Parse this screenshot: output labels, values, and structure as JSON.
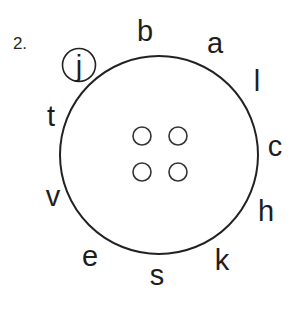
{
  "exercise": {
    "number_label": "2.",
    "button_circle": {
      "center": [
        159,
        155
      ],
      "radius": 100,
      "stroke": "#222222"
    },
    "holes": [
      {
        "center": [
          142,
          136
        ],
        "radius": 9
      },
      {
        "center": [
          178,
          136
        ],
        "radius": 9
      },
      {
        "center": [
          142,
          172
        ],
        "radius": 9
      },
      {
        "center": [
          178,
          172
        ],
        "radius": 9
      }
    ],
    "circled_letter": {
      "text": "j",
      "center": [
        79,
        65
      ],
      "radius": 17
    },
    "letters": [
      {
        "text": "b",
        "x": 145,
        "y": 31
      },
      {
        "text": "a",
        "x": 215,
        "y": 43
      },
      {
        "text": "l",
        "x": 257,
        "y": 81
      },
      {
        "text": "c",
        "x": 275,
        "y": 146
      },
      {
        "text": "h",
        "x": 266,
        "y": 211
      },
      {
        "text": "k",
        "x": 222,
        "y": 260
      },
      {
        "text": "s",
        "x": 157,
        "y": 275
      },
      {
        "text": "e",
        "x": 90,
        "y": 256
      },
      {
        "text": "v",
        "x": 53,
        "y": 196
      },
      {
        "text": "t",
        "x": 51,
        "y": 116
      }
    ]
  }
}
